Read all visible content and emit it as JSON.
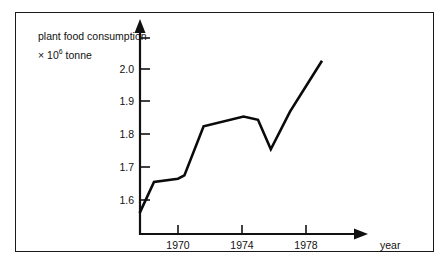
{
  "figure": {
    "background_color": "#ffffff",
    "border_color": "#1a1a1a",
    "line_color": "#0a0a0a"
  },
  "labels": {
    "y_axis_title_line1": "plant food consumption",
    "y_axis_title_line2_prefix": "× 10",
    "y_axis_title_line2_sup": "6",
    "y_axis_title_line2_suffix": " tonne",
    "x_axis_title": "year"
  },
  "chart_data": {
    "type": "line",
    "title": "",
    "xlabel": "year",
    "ylabel": "plant food consumption × 10⁶ tonne",
    "xlim": [
      1967.5,
      1979.5
    ],
    "ylim": [
      1.54,
      2.06
    ],
    "grid": false,
    "legend": false,
    "y_ticks": [
      1.6,
      1.7,
      1.8,
      1.9,
      2.0
    ],
    "y_tick_labels": [
      "1.6",
      "1.7",
      "1.8",
      "1.9",
      "2.0"
    ],
    "x_ticks": [
      1970,
      1974,
      1978
    ],
    "x_tick_labels": [
      "1970",
      "1974",
      "1978"
    ],
    "series": [
      {
        "name": "plant food consumption",
        "x": [
          1967.6,
          1968.5,
          1970.0,
          1970.4,
          1971.6,
          1974.1,
          1975.0,
          1975.8,
          1977.0,
          1979.0
        ],
        "values": [
          1.56,
          1.655,
          1.665,
          1.675,
          1.825,
          1.855,
          1.845,
          1.755,
          1.87,
          2.025
        ]
      }
    ]
  }
}
